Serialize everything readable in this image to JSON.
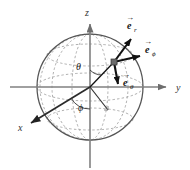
{
  "figure": {
    "background_color": "#ffffff",
    "line_color": "#000000",
    "axis_color": "#808080",
    "grid_color": "#9a9a9a",
    "sphere": {
      "center_x": 90,
      "center_y": 87,
      "radius": 53,
      "outline_color": "#555555",
      "grid_style": "dashed",
      "latitude_count": 3,
      "longitude_count": 3
    },
    "axes": [
      {
        "name": "z",
        "label": "z",
        "direction": "up",
        "tip_x": 90,
        "tip_y": 17
      },
      {
        "name": "y",
        "label": "y",
        "direction": "right",
        "tip_x": 173,
        "tip_y": 87
      },
      {
        "name": "x",
        "label": "x",
        "direction": "down-left",
        "tip_x": 27,
        "tip_y": 126
      }
    ],
    "angles": [
      {
        "name": "theta",
        "label": "θ",
        "label_x": 79,
        "label_y": 67,
        "description": "polar angle from z-axis"
      },
      {
        "name": "phi",
        "label": "ϕ",
        "label_x": 81,
        "label_y": 107,
        "description": "azimuthal angle in xy-plane"
      }
    ],
    "point": {
      "name": "point-p",
      "x": 114,
      "y": 62,
      "marker": "square",
      "marker_color": "#6b6b6b"
    },
    "vectors": [
      {
        "name": "e-r",
        "label": "e",
        "subscript": "r",
        "arrow_accent": "→",
        "tail_x": 114,
        "tail_y": 62,
        "head_x": 132,
        "head_y": 36,
        "label_x": 131,
        "label_y": 22
      },
      {
        "name": "e-phi",
        "label": "e",
        "subscript": "ϕ",
        "arrow_accent": "→",
        "tail_x": 114,
        "tail_y": 62,
        "head_x": 143,
        "head_y": 55,
        "label_x": 149,
        "label_y": 47
      },
      {
        "name": "e-theta",
        "label": "e",
        "subscript": "θ",
        "arrow_accent": "→",
        "tail_x": 114,
        "tail_y": 62,
        "head_x": 119,
        "head_y": 88,
        "label_x": 123,
        "label_y": 86
      }
    ],
    "radial_line": {
      "name": "radius-to-point",
      "from_x": 90,
      "from_y": 87,
      "to_x": 114,
      "to_y": 62
    },
    "projection_line": {
      "name": "projection-in-equatorial-plane",
      "from_x": 90,
      "from_y": 87,
      "to_x": 108,
      "to_y": 110
    }
  }
}
